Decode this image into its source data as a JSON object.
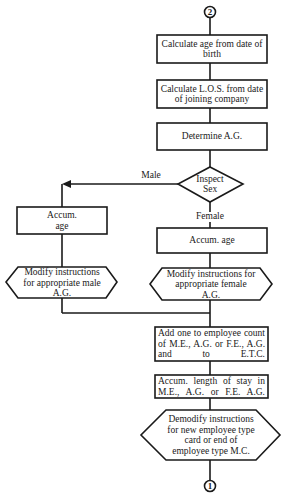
{
  "diagram": {
    "type": "flowchart",
    "connectors": {
      "top": "2",
      "bottom": "1"
    },
    "nodes": {
      "calc_age": "Calculate age from date of birth",
      "calc_los": "Calculate L.O.S. from date of joining company",
      "determine_ag": "Determine A.G.",
      "inspect_sex": "Inspect Sex",
      "male_accum_age": "Accum. age",
      "male_modify": "Modify instructions for appropriate male A.G.",
      "female_accum_age": "Accum. age",
      "female_modify": "Modify instructions for appropriate female A.G.",
      "add_count": "Add one to employee count of M.E., A.G. or F.E., A.G. and to E.T.C.",
      "accum_length": "Accum. length of stay in M.E., A.G. or F.E. A.G.",
      "demodify": "Demodify instructions for new employee type card or end of employee type M.C."
    },
    "edge_labels": {
      "male": "Male",
      "female": "Female"
    },
    "colors": {
      "stroke": "#1a1a1a",
      "background": "#ffffff"
    }
  }
}
